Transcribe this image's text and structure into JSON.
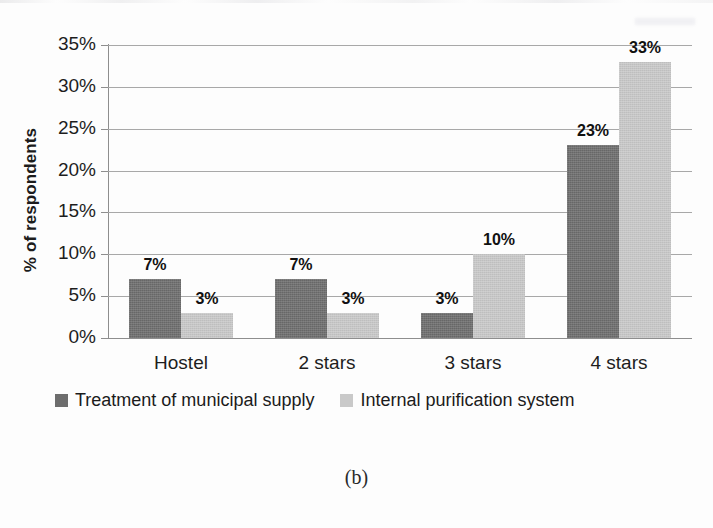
{
  "figure": {
    "caption": "(b)"
  },
  "legend": {
    "position": "below-axis",
    "entries": [
      {
        "label": "Treatment of municipal supply",
        "color": "#6d6d6d",
        "swatch": "dark-square-swatch"
      },
      {
        "label": "Internal purification system",
        "color": "#c9c9c9",
        "swatch": "light-square-swatch"
      }
    ]
  },
  "chart_data": {
    "type": "bar",
    "title": "",
    "subtitle": "",
    "xlabel": "",
    "ylabel": "% of respondents",
    "categories": [
      "Hostel",
      "2 stars",
      "3 stars",
      "4 stars"
    ],
    "series": [
      {
        "name": "Treatment of municipal supply",
        "color": "#6d6d6d",
        "values": [
          7,
          7,
          3,
          23
        ],
        "labels": [
          "7%",
          "7%",
          "3%",
          "23%"
        ]
      },
      {
        "name": "Internal purification system",
        "color": "#c9c9c9",
        "values": [
          3,
          3,
          10,
          33
        ],
        "labels": [
          "3%",
          "3%",
          "10%",
          "33%"
        ]
      }
    ],
    "ylim": [
      0,
      35
    ],
    "ytick_values": [
      0,
      5,
      10,
      15,
      20,
      25,
      30,
      35
    ],
    "ytick_labels": [
      "0%",
      "5%",
      "10%",
      "15%",
      "20%",
      "25%",
      "30%",
      "35%"
    ],
    "grid": "horizontal",
    "legend_position": "bottom",
    "value_format": "percent",
    "bar_grouping": "grouped"
  }
}
